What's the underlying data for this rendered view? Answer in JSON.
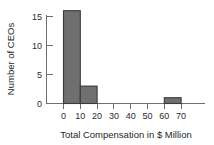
{
  "chart_data": {
    "type": "bar",
    "title": "",
    "subtitle": "",
    "xlabel": "Total Compensation in $ Million",
    "ylabel": "Number of CEOs",
    "bin_width": 10,
    "bin_starts": [
      0,
      10,
      20,
      30,
      40,
      50,
      60
    ],
    "categories": [
      "0-10",
      "10-20",
      "20-30",
      "30-40",
      "40-50",
      "50-60",
      "60-70"
    ],
    "values": [
      16,
      3,
      0,
      0,
      0,
      0,
      1
    ],
    "xlim": [
      0,
      70
    ],
    "ylim": [
      0,
      16
    ],
    "x_ticks": [
      0,
      10,
      20,
      30,
      40,
      50,
      60,
      70
    ],
    "x_tick_labels": [
      "0",
      "10",
      "20",
      "30",
      "40",
      "50",
      "60",
      "70"
    ],
    "y_ticks": [
      0,
      5,
      10,
      15
    ],
    "y_tick_labels": [
      "0",
      "5",
      "10",
      "15"
    ],
    "grid": false,
    "legend": false,
    "legend_position": "none",
    "bar_fill_color": "#6f6f6f",
    "bar_edge_color": "#3a3a3a",
    "axis_color": "#6e6e6e",
    "background_color": "#ffffff"
  }
}
